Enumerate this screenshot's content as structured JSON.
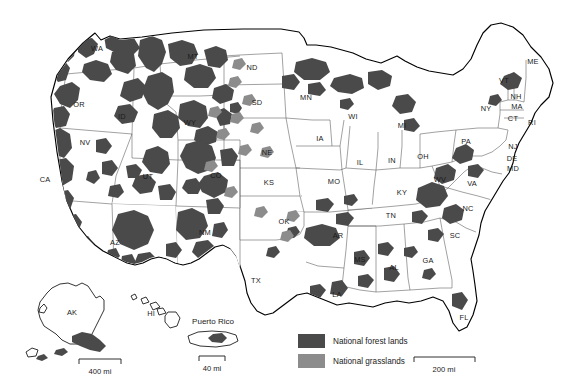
{
  "map": {
    "title": "United States National Forest Lands and National Grasslands",
    "background_color": "#ffffff",
    "outline_color": "#000000",
    "state_border_color": "#555555"
  },
  "legend": {
    "items": [
      {
        "label": "National forest lands",
        "color": "#4a4a4a",
        "key": "forest"
      },
      {
        "label": "National grasslands",
        "color": "#8c8c8c",
        "key": "grassland"
      }
    ]
  },
  "scales": [
    {
      "key": "main",
      "label": "200 mi",
      "length_px": 61
    },
    {
      "key": "alaska",
      "label": "400 mi",
      "length_px": 42
    },
    {
      "key": "puerto-rico",
      "label": "40 mi",
      "length_px": 26
    }
  ],
  "insets": [
    {
      "key": "alaska",
      "label": "AK"
    },
    {
      "key": "hawaii",
      "label": "HI"
    },
    {
      "key": "puerto-rico",
      "label": "Puerto Rico"
    }
  ],
  "states": [
    {
      "abbr": "WA",
      "x": 97,
      "y": 49
    },
    {
      "abbr": "OR",
      "x": 79,
      "y": 105
    },
    {
      "abbr": "CA",
      "x": 45,
      "y": 180
    },
    {
      "abbr": "NV",
      "x": 85,
      "y": 143
    },
    {
      "abbr": "ID",
      "x": 122,
      "y": 117
    },
    {
      "abbr": "MT",
      "x": 193,
      "y": 57
    },
    {
      "abbr": "WY",
      "x": 190,
      "y": 123
    },
    {
      "abbr": "UT",
      "x": 148,
      "y": 177
    },
    {
      "abbr": "CO",
      "x": 216,
      "y": 176
    },
    {
      "abbr": "AZ",
      "x": 115,
      "y": 243
    },
    {
      "abbr": "NM",
      "x": 205,
      "y": 233
    },
    {
      "abbr": "ND",
      "x": 252,
      "y": 68
    },
    {
      "abbr": "SD",
      "x": 257,
      "y": 103
    },
    {
      "abbr": "NE",
      "x": 267,
      "y": 153
    },
    {
      "abbr": "KS",
      "x": 269,
      "y": 183
    },
    {
      "abbr": "OK",
      "x": 284,
      "y": 222
    },
    {
      "abbr": "TX",
      "x": 256,
      "y": 281
    },
    {
      "abbr": "MN",
      "x": 306,
      "y": 98
    },
    {
      "abbr": "IA",
      "x": 320,
      "y": 139
    },
    {
      "abbr": "MO",
      "x": 334,
      "y": 182
    },
    {
      "abbr": "AR",
      "x": 338,
      "y": 236
    },
    {
      "abbr": "LA",
      "x": 337,
      "y": 295
    },
    {
      "abbr": "WI",
      "x": 353,
      "y": 117
    },
    {
      "abbr": "IL",
      "x": 360,
      "y": 163
    },
    {
      "abbr": "MS",
      "x": 360,
      "y": 260
    },
    {
      "abbr": "MI",
      "x": 402,
      "y": 126
    },
    {
      "abbr": "IN",
      "x": 392,
      "y": 161
    },
    {
      "abbr": "KY",
      "x": 402,
      "y": 193
    },
    {
      "abbr": "TN",
      "x": 391,
      "y": 216
    },
    {
      "abbr": "AL",
      "x": 394,
      "y": 268
    },
    {
      "abbr": "GA",
      "x": 428,
      "y": 261
    },
    {
      "abbr": "FL",
      "x": 464,
      "y": 318
    },
    {
      "abbr": "OH",
      "x": 423,
      "y": 157
    },
    {
      "abbr": "WV",
      "x": 440,
      "y": 180
    },
    {
      "abbr": "VA",
      "x": 472,
      "y": 184
    },
    {
      "abbr": "NC",
      "x": 468,
      "y": 209
    },
    {
      "abbr": "SC",
      "x": 455,
      "y": 236
    },
    {
      "abbr": "PA",
      "x": 466,
      "y": 142
    },
    {
      "abbr": "NY",
      "x": 486,
      "y": 109
    },
    {
      "abbr": "ME",
      "x": 533,
      "y": 62
    },
    {
      "abbr": "VT",
      "x": 504,
      "y": 81
    },
    {
      "abbr": "NH",
      "x": 516,
      "y": 97
    },
    {
      "abbr": "MA",
      "x": 517,
      "y": 107
    },
    {
      "abbr": "CT",
      "x": 513,
      "y": 119
    },
    {
      "abbr": "RI",
      "x": 532,
      "y": 123
    },
    {
      "abbr": "NJ",
      "x": 513,
      "y": 147
    },
    {
      "abbr": "DE",
      "x": 512,
      "y": 159
    },
    {
      "abbr": "MD",
      "x": 513,
      "y": 169
    }
  ],
  "chart_data": {
    "type": "map",
    "categories": [
      "National forest lands",
      "National grasslands"
    ],
    "colors": [
      "#4a4a4a",
      "#8c8c8c"
    ],
    "regions_with_forest": [
      "WA",
      "OR",
      "CA",
      "ID",
      "MT",
      "WY",
      "UT",
      "CO",
      "AZ",
      "NM",
      "NV",
      "SD",
      "MN",
      "WI",
      "MI",
      "AR",
      "MO",
      "TN",
      "NC",
      "VA",
      "WV",
      "GA",
      "FL",
      "AL",
      "MS",
      "LA",
      "PA",
      "NH",
      "VT",
      "ME",
      "AK",
      "PR"
    ],
    "regions_with_grassland": [
      "ND",
      "SD",
      "NE",
      "CO",
      "WY",
      "KS",
      "OK",
      "TX",
      "NM",
      "MT"
    ]
  }
}
